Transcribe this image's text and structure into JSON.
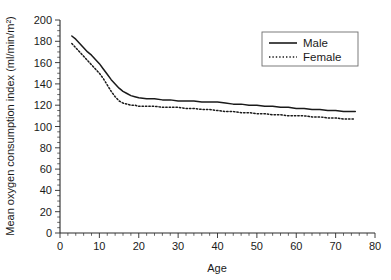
{
  "chart_data": {
    "type": "line",
    "title": "",
    "xlabel": "Age",
    "ylabel": "Mean oxygen consumption index (ml/min/m²)",
    "xlim": [
      0,
      80
    ],
    "ylim": [
      0,
      200
    ],
    "xticks": [
      0,
      10,
      20,
      30,
      40,
      50,
      60,
      70,
      80
    ],
    "xtick_labels": [
      "0",
      "10",
      "20",
      "30",
      "40",
      "50",
      "60",
      "70",
      "80"
    ],
    "yticks": [
      0,
      20,
      40,
      60,
      80,
      100,
      120,
      140,
      160,
      180,
      200
    ],
    "ytick_labels": [
      "0",
      "20",
      "40",
      "60",
      "80",
      "100",
      "120",
      "140",
      "160",
      "180",
      "200"
    ],
    "xminor_interval": 2,
    "yminor_interval": 5,
    "grid": false,
    "legend_position": "upper right",
    "series": [
      {
        "name": "Male",
        "style": "solid",
        "color": "#1a1a1a",
        "x": [
          3,
          4,
          5,
          6,
          7,
          8,
          9,
          10,
          11,
          12,
          13,
          14,
          15,
          16,
          17,
          18,
          19,
          20,
          22,
          24,
          26,
          28,
          30,
          32,
          34,
          36,
          38,
          40,
          42,
          44,
          46,
          48,
          50,
          52,
          54,
          56,
          58,
          60,
          62,
          64,
          66,
          68,
          70,
          72,
          74,
          75
        ],
        "y": [
          185,
          182,
          178,
          174,
          170,
          167,
          163,
          159,
          154,
          149,
          144,
          140,
          136,
          133,
          131,
          129,
          128,
          127,
          126,
          126,
          125,
          125,
          124,
          124,
          124,
          123,
          123,
          123,
          122,
          121,
          121,
          120,
          120,
          119,
          119,
          118,
          118,
          117,
          117,
          116,
          116,
          115,
          115,
          114,
          114,
          114
        ]
      },
      {
        "name": "Female",
        "style": "dotted",
        "color": "#1a1a1a",
        "x": [
          3,
          4,
          5,
          6,
          7,
          8,
          9,
          10,
          11,
          12,
          13,
          14,
          15,
          16,
          17,
          18,
          19,
          20,
          22,
          24,
          26,
          28,
          30,
          32,
          34,
          36,
          38,
          40,
          42,
          44,
          46,
          48,
          50,
          52,
          54,
          56,
          58,
          60,
          62,
          64,
          66,
          68,
          70,
          72,
          74,
          75
        ],
        "y": [
          178,
          174,
          170,
          166,
          162,
          158,
          154,
          150,
          145,
          139,
          133,
          128,
          124,
          122,
          121,
          120,
          120,
          119,
          119,
          119,
          118,
          118,
          118,
          117,
          117,
          116,
          116,
          115,
          114,
          114,
          113,
          113,
          112,
          112,
          111,
          111,
          110,
          110,
          110,
          109,
          109,
          108,
          108,
          107,
          107,
          107
        ]
      }
    ]
  },
  "legend": {
    "entries": [
      {
        "label": "Male"
      },
      {
        "label": "Female"
      }
    ]
  },
  "axes": {
    "x_title": "Age",
    "y_title": "Mean oxygen consumption index (ml/min/m²)"
  }
}
